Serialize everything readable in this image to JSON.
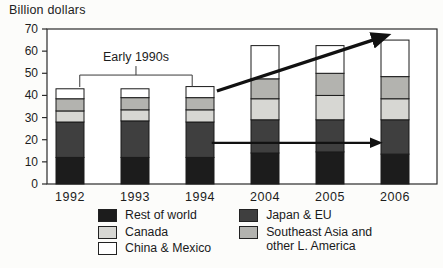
{
  "figure": {
    "y_axis_title": "Billion dollars"
  },
  "chart_data": {
    "type": "bar",
    "stacked": true,
    "title": "",
    "xlabel": "",
    "ylabel": "Billion dollars",
    "ylim": [
      0,
      70
    ],
    "yticks": [
      0,
      10,
      20,
      30,
      40,
      50,
      60,
      70
    ],
    "grid": false,
    "categories": [
      "1992",
      "1993",
      "1994",
      "2004",
      "2005",
      "2006"
    ],
    "series": [
      {
        "key": "rest_of_world",
        "name": "Rest of world",
        "color": "#1c1c1c",
        "values": [
          12,
          12,
          12,
          14,
          14.5,
          13.5
        ]
      },
      {
        "key": "japan_eu",
        "name": "Japan & EU",
        "color": "#3f3f3f",
        "values": [
          16,
          16.5,
          16,
          15,
          14.5,
          15.5
        ]
      },
      {
        "key": "canada",
        "name": "Canada",
        "color": "#d7d7d3",
        "values": [
          5,
          5,
          5.5,
          9.5,
          11,
          9.5
        ]
      },
      {
        "key": "se_asia",
        "name": "Southeast Asia and other L. America",
        "color": "#b3b3af",
        "values": [
          5.5,
          5.5,
          5.5,
          9,
          10,
          10
        ]
      },
      {
        "key": "china_mexico",
        "name": "China & Mexico",
        "color": "#ffffff",
        "values": [
          4.5,
          4,
          5,
          15,
          12.5,
          16.5
        ]
      }
    ],
    "annotations": {
      "bracket": {
        "label": "Early 1990s",
        "from_cat": 0.15,
        "to_cat": 1.88,
        "y_value": 49.2,
        "drop": 5.4
      },
      "arrows": [
        {
          "name": "growth-trend-arrow",
          "from_cat": 2.26,
          "from_value": 42,
          "to_cat": 4.87,
          "to_value": 67,
          "width": 3.4
        },
        {
          "name": "flat-trend-arrow",
          "from_cat": 2.18,
          "from_value": 18.6,
          "to_cat": 4.76,
          "to_value": 18.6,
          "width": 2.2
        }
      ]
    },
    "legend": {
      "position": "bottom",
      "columns": [
        [
          "rest_of_world",
          "canada",
          "china_mexico"
        ],
        [
          "japan_eu",
          "se_asia"
        ]
      ]
    }
  }
}
